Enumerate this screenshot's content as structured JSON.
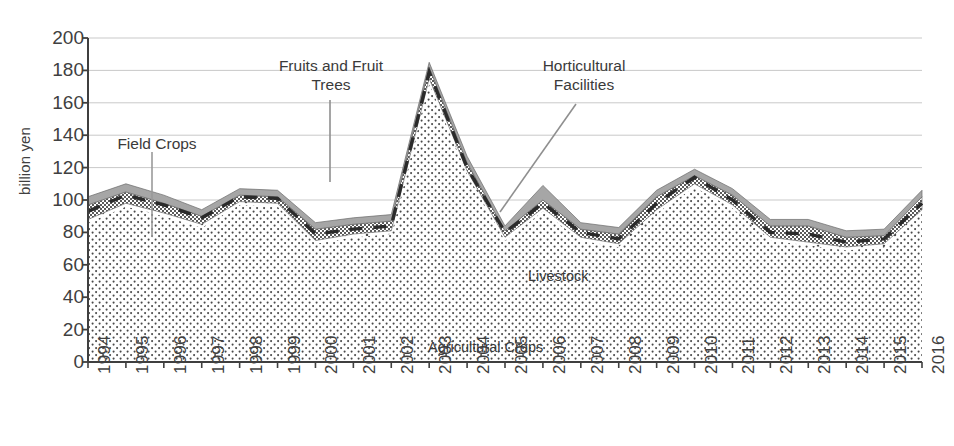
{
  "chart_data": {
    "type": "area",
    "stacked": true,
    "title": "",
    "xlabel": "",
    "ylabel": "billion yen",
    "ylim": [
      0,
      200
    ],
    "ytick_step": 20,
    "yticks": [
      "200",
      "180",
      "160",
      "140",
      "120",
      "100",
      "80",
      "60",
      "40",
      "20",
      "0"
    ],
    "grid": true,
    "grid_axis": "y",
    "legend_position": "in-chart annotations",
    "categories": [
      "1994",
      "1995",
      "1996",
      "1997",
      "1998",
      "1999",
      "2000",
      "2001",
      "2002",
      "2003",
      "2004",
      "2005",
      "2006",
      "2007",
      "2008",
      "2009",
      "2010",
      "2011",
      "2012",
      "2013",
      "2014",
      "2015",
      "2016"
    ],
    "series": [
      {
        "name": "Agricultural Crops",
        "pattern": "dense-dots",
        "label_position": "inside-bottom",
        "values": [
          86,
          96,
          90,
          83,
          97,
          96,
          73,
          77,
          79,
          172,
          116,
          75,
          93,
          75,
          71,
          92,
          108,
          95,
          75,
          72,
          69,
          71,
          92
        ]
      },
      {
        "name": "Livestock",
        "pattern": "sparse-dots",
        "label_position": "inside-middle",
        "values": [
          2,
          2,
          2,
          2,
          2,
          2,
          2,
          2,
          2,
          3,
          2,
          2,
          2,
          2,
          2,
          2,
          2,
          2,
          2,
          2,
          2,
          2,
          2
        ]
      },
      {
        "name": "Fruits and Fruit Trees",
        "pattern": "checkered",
        "label_position": "callout-top-left",
        "values": [
          9,
          7,
          6,
          5,
          4,
          4,
          7,
          6,
          6,
          7,
          5,
          4,
          5,
          5,
          6,
          8,
          5,
          6,
          7,
          10,
          6,
          5,
          8
        ]
      },
      {
        "name": "Horticultural Facilities",
        "pattern": "solid-gray",
        "label_position": "callout-top-right",
        "values": [
          5,
          5,
          5,
          4,
          4,
          4,
          4,
          4,
          4,
          3,
          4,
          3,
          9,
          4,
          4,
          4,
          4,
          4,
          4,
          4,
          4,
          4,
          4
        ]
      }
    ],
    "overlay_series": [
      {
        "name": "Field Crops",
        "pattern": "dashed-line",
        "label_position": "callout-left",
        "values": [
          93,
          103,
          97,
          89,
          102,
          101,
          79,
          82,
          84,
          179,
          120,
          80,
          98,
          80,
          76,
          98,
          114,
          100,
          80,
          79,
          74,
          76,
          98
        ]
      }
    ],
    "annotations": [
      {
        "text": "Field Crops",
        "has_leader_line": true
      },
      {
        "text": "Fruits and Fruit\nTrees",
        "has_leader_line": true
      },
      {
        "text": "Horticultural\nFacilities",
        "has_leader_line": true
      },
      {
        "text": "Livestock",
        "has_leader_line": false
      },
      {
        "text": "Agricultural Crops",
        "has_leader_line": false
      }
    ],
    "colors": {
      "axis": "#3f3f3f",
      "gridline": "#c9c9c9",
      "horticultural_facilities": "#a6a6a6",
      "fruits_and_fruit_trees": "#6e6e6e",
      "livestock": "#ffffff",
      "agricultural_crops": "#ffffff",
      "field_crops_dashes": "#2b2b2b",
      "text": "#404040"
    }
  }
}
